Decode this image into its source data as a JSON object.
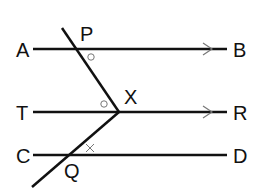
{
  "diagram": {
    "colors": {
      "line": "#111111",
      "mark": "#777777",
      "background": "#ffffff"
    },
    "labels": {
      "A": "A",
      "B": "B",
      "P": "P",
      "X": "X",
      "T": "T",
      "R": "R",
      "C": "C",
      "Q": "Q",
      "D": "D"
    },
    "lines": [
      {
        "name": "AB",
        "from": "A",
        "to": "B",
        "arrow": true
      },
      {
        "name": "TR",
        "from": "T",
        "to": "R",
        "arrow": true
      },
      {
        "name": "CD",
        "from": "C",
        "to": "D",
        "arrow": false
      }
    ],
    "marks": [
      {
        "at": "P",
        "symbol": "circle",
        "meaning": "equal angle"
      },
      {
        "at": "X",
        "symbol": "circle",
        "meaning": "equal angle"
      },
      {
        "at": "Q",
        "symbol": "cross",
        "meaning": "marked angle"
      }
    ]
  }
}
